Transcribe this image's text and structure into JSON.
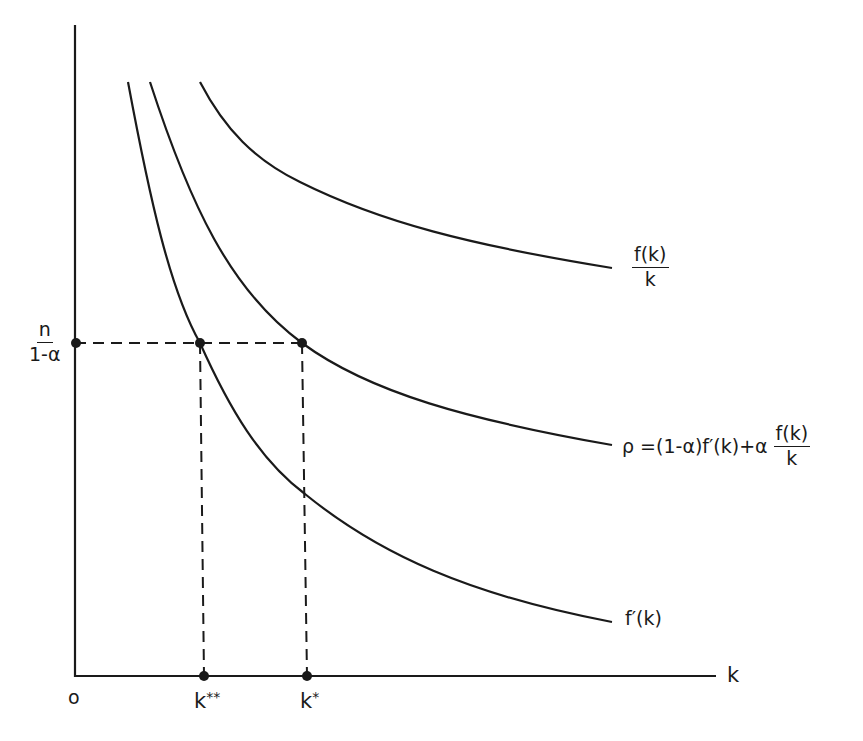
{
  "diagram": {
    "type": "economics-growth-diagram",
    "axes": {
      "x_label": "k",
      "origin_label": "o",
      "y_tick": {
        "numerator": "n",
        "denominator": "1-α"
      },
      "x_ticks": [
        {
          "base": "k",
          "sup": "**"
        },
        {
          "base": "k",
          "sup": "*"
        }
      ]
    },
    "curves": [
      {
        "id": "average-product",
        "label_num": "f(k)",
        "label_den": "k"
      },
      {
        "id": "rho",
        "label_prefix": "ρ =(1-α)f′(k)+α",
        "label_num": "f(k)",
        "label_den": "k"
      },
      {
        "id": "marginal-product",
        "label": "f′(k)"
      }
    ],
    "line_color": "#1a1a1a",
    "background": "#ffffff"
  }
}
